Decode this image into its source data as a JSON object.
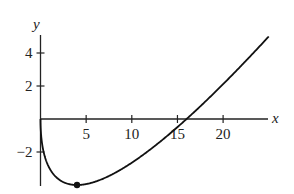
{
  "chart_data": {
    "type": "line",
    "title": "",
    "xlabel": "x",
    "ylabel": "y",
    "xlim": [
      -0.3,
      25.3
    ],
    "ylim": [
      -4.1,
      5.0
    ],
    "grid": false,
    "legend": null,
    "x_ticks": [
      5,
      10,
      15,
      20
    ],
    "x_tick_labels": [
      "5",
      "10",
      "15",
      "20"
    ],
    "y_ticks": [
      -2,
      2,
      4
    ],
    "y_tick_labels": [
      "−2",
      "2",
      "4"
    ],
    "series": [
      {
        "name": "f(x)",
        "x": [
          0,
          0.1,
          0.25,
          0.5,
          1,
          1.5,
          2,
          3,
          4,
          5,
          6,
          8,
          10,
          12,
          14,
          16,
          18,
          20,
          22,
          24,
          25
        ],
        "y": [
          0,
          -1.16,
          -1.75,
          -2.33,
          -3.0,
          -3.4,
          -3.66,
          -3.93,
          -4.0,
          -3.94,
          -3.8,
          -3.31,
          -2.65,
          -1.86,
          -0.97,
          0,
          1.03,
          2.11,
          3.24,
          4.4,
          5.0
        ]
      }
    ],
    "annotations": [
      {
        "type": "point",
        "x": 4,
        "y": -4,
        "label": ""
      }
    ],
    "axis_color": "#222222",
    "curve_color": "#111111"
  }
}
